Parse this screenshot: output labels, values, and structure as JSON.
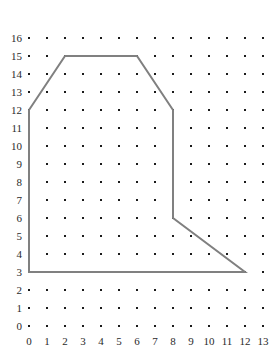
{
  "chart_data": {
    "type": "scatter",
    "title": "",
    "xlabel": "",
    "ylabel": "",
    "xlim": [
      0,
      13
    ],
    "ylim": [
      0,
      16
    ],
    "grid": true,
    "grid_style": "dot-lattice",
    "x_ticks": [
      0,
      1,
      2,
      3,
      4,
      5,
      6,
      7,
      8,
      9,
      10,
      11,
      12,
      13
    ],
    "y_ticks": [
      0,
      1,
      2,
      3,
      4,
      5,
      6,
      7,
      8,
      9,
      10,
      11,
      12,
      13,
      14,
      15,
      16
    ],
    "x_tick_labels": [
      "0",
      "1",
      "2",
      "3",
      "4",
      "5",
      "6",
      "7",
      "8",
      "9",
      "10",
      "11",
      "12",
      "13"
    ],
    "y_tick_labels": [
      "0",
      "1",
      "2",
      "3",
      "4",
      "5",
      "6",
      "7",
      "8",
      "9",
      "10",
      "11",
      "12",
      "13",
      "14",
      "15",
      "16"
    ],
    "legend": [],
    "annotations": [],
    "series": [
      {
        "name": "polygon",
        "type": "closed-polygon",
        "closed": true,
        "line_color": "#808080",
        "line_width": 2,
        "fill": "none",
        "vertices": [
          [
            0,
            3
          ],
          [
            0,
            12
          ],
          [
            2,
            15
          ],
          [
            6,
            15
          ],
          [
            8,
            12
          ],
          [
            8,
            6
          ],
          [
            12,
            3
          ]
        ],
        "edges": [
          {
            "from": [
              0,
              3
            ],
            "to": [
              0,
              12
            ],
            "orientation": "vertical"
          },
          {
            "from": [
              0,
              12
            ],
            "to": [
              2,
              15
            ],
            "orientation": "diagonal"
          },
          {
            "from": [
              2,
              15
            ],
            "to": [
              6,
              15
            ],
            "orientation": "horizontal"
          },
          {
            "from": [
              6,
              15
            ],
            "to": [
              8,
              12
            ],
            "orientation": "diagonal"
          },
          {
            "from": [
              8,
              12
            ],
            "to": [
              8,
              6
            ],
            "orientation": "vertical"
          },
          {
            "from": [
              8,
              6
            ],
            "to": [
              12,
              3
            ],
            "orientation": "diagonal"
          },
          {
            "from": [
              12,
              3
            ],
            "to": [
              0,
              3
            ],
            "orientation": "horizontal"
          }
        ]
      }
    ],
    "lattice": {
      "dot_color": "#1a1a1a",
      "dot_size": 2,
      "columns": 14,
      "rows": 17
    }
  },
  "geometry": {
    "origin_x_px": 29,
    "origin_y_px": 326,
    "step_px": 18
  }
}
